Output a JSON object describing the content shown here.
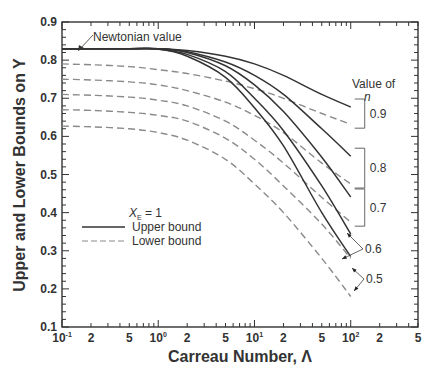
{
  "chart_data": {
    "type": "line",
    "title": "",
    "xlabel": "Carreau Number, Λ",
    "ylabel": "Upper and Lower Bounds on Y",
    "xscale": "log",
    "xlim": [
      0.1,
      500
    ],
    "ylim": [
      0.1,
      0.9
    ],
    "grid": false,
    "x_tick_labels": [
      {
        "value": 0.1,
        "base": "10",
        "exp": "-1"
      },
      {
        "value": 0.2,
        "base": "2"
      },
      {
        "value": 0.5,
        "base": "5"
      },
      {
        "value": 1,
        "base": "10",
        "exp": "0"
      },
      {
        "value": 2,
        "base": "2"
      },
      {
        "value": 5,
        "base": "5"
      },
      {
        "value": 10,
        "base": "10",
        "exp": "1"
      },
      {
        "value": 20,
        "base": "2"
      },
      {
        "value": 50,
        "base": "5"
      },
      {
        "value": 100,
        "base": "10",
        "exp": "2"
      },
      {
        "value": 200,
        "base": "2"
      },
      {
        "value": 500,
        "base": "5"
      }
    ],
    "y_ticks": [
      0.1,
      0.2,
      0.3,
      0.4,
      0.5,
      0.6,
      0.7,
      0.8,
      0.9
    ],
    "y_tick_labels": [
      "0.1",
      "0.2",
      "0.3",
      "0.4",
      "0.5",
      "0.6",
      "0.7",
      "0.8",
      "0.9"
    ],
    "x": [
      0.1,
      0.2,
      0.5,
      1,
      2,
      5,
      10,
      20,
      50,
      100
    ],
    "series": [
      {
        "name": "Upper bound, n = 0.9",
        "n": 0.9,
        "style": "solid",
        "values": [
          0.83,
          0.83,
          0.83,
          0.83,
          0.825,
          0.81,
          0.79,
          0.76,
          0.71,
          0.677
        ]
      },
      {
        "name": "Lower bound, n = 0.9",
        "n": 0.9,
        "style": "dashed",
        "values": [
          0.79,
          0.788,
          0.783,
          0.775,
          0.765,
          0.745,
          0.725,
          0.7,
          0.66,
          0.632
        ]
      },
      {
        "name": "Upper bound, n = 0.8",
        "n": 0.8,
        "style": "solid",
        "values": [
          0.83,
          0.83,
          0.83,
          0.83,
          0.822,
          0.795,
          0.76,
          0.71,
          0.62,
          0.548
        ]
      },
      {
        "name": "Lower bound, n = 0.8",
        "n": 0.8,
        "style": "dashed",
        "values": [
          0.75,
          0.748,
          0.743,
          0.735,
          0.72,
          0.69,
          0.655,
          0.61,
          0.53,
          0.475
        ]
      },
      {
        "name": "Upper bound, n = 0.7",
        "n": 0.7,
        "style": "solid",
        "values": [
          0.83,
          0.83,
          0.83,
          0.83,
          0.82,
          0.785,
          0.735,
          0.665,
          0.545,
          0.441
        ]
      },
      {
        "name": "Lower bound, n = 0.7",
        "n": 0.7,
        "style": "dashed",
        "values": [
          0.71,
          0.708,
          0.703,
          0.695,
          0.68,
          0.64,
          0.59,
          0.53,
          0.44,
          0.375
        ]
      },
      {
        "name": "Upper bound, n = 0.6",
        "n": 0.6,
        "style": "solid",
        "values": [
          0.83,
          0.83,
          0.83,
          0.829,
          0.815,
          0.77,
          0.7,
          0.615,
          0.47,
          0.344
        ]
      },
      {
        "name": "Lower bound, n = 0.6",
        "n": 0.6,
        "style": "dashed",
        "values": [
          0.67,
          0.668,
          0.663,
          0.655,
          0.64,
          0.595,
          0.54,
          0.47,
          0.37,
          0.28
        ]
      },
      {
        "name": "Upper bound, n = 0.5",
        "n": 0.5,
        "style": "solid",
        "values": [
          0.83,
          0.83,
          0.83,
          0.829,
          0.81,
          0.755,
          0.675,
          0.575,
          0.4,
          0.285
        ]
      },
      {
        "name": "Lower bound, n = 0.5",
        "n": 0.5,
        "style": "dashed",
        "values": [
          0.627,
          0.625,
          0.62,
          0.61,
          0.59,
          0.54,
          0.475,
          0.4,
          0.28,
          0.18
        ]
      }
    ],
    "annotations": {
      "newtonian": {
        "text": "Newtonian value",
        "value": 0.83
      },
      "value_of_n_title": "Value of",
      "value_of_n_symbol": "n",
      "n_labels": [
        "0.9",
        "0.8",
        "0.7",
        "0.6",
        "0.5"
      ]
    },
    "legend": {
      "position": "center-left",
      "title_main": "X",
      "title_sub": "E",
      "title_rest": " = 1",
      "entries": [
        {
          "label": "Upper bound",
          "style": "solid"
        },
        {
          "label": "Lower bound",
          "style": "dashed"
        }
      ]
    },
    "colors": {
      "upper": "#333333",
      "lower": "#8a8a8a",
      "axis": "#333333",
      "text": "#333333"
    }
  }
}
